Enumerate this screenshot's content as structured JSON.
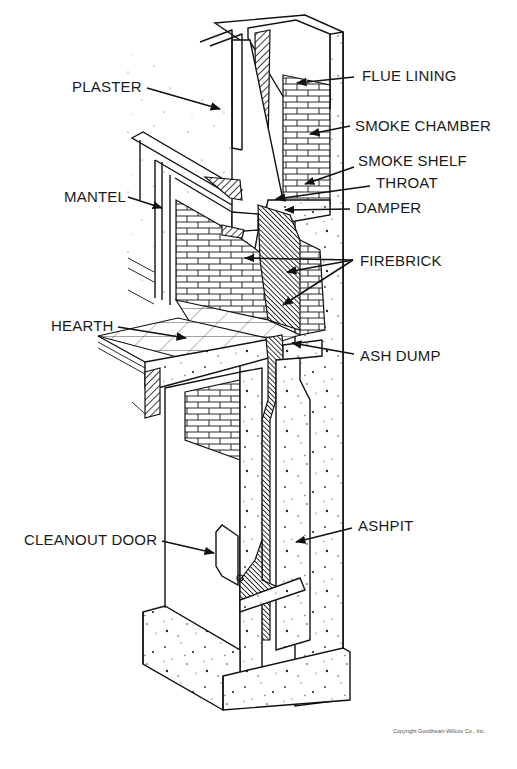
{
  "labels": {
    "plaster": "PLASTER",
    "flue_lining": "FLUE LINING",
    "smoke_chamber": "SMOKE CHAMBER",
    "smoke_shelf": "SMOKE SHELF",
    "throat": "THROAT",
    "damper": "DAMPER",
    "mantel": "MANTEL",
    "firebrick": "FIREBRICK",
    "hearth": "HEARTH",
    "ash_dump": "ASH DUMP",
    "cleanout_door": "CLEANOUT DOOR",
    "ashpit": "ASHPIT"
  },
  "copyright": "Copyright Goodheart-Willcox Co., Inc.",
  "colors": {
    "ink": "#111111",
    "background": "#ffffff"
  }
}
